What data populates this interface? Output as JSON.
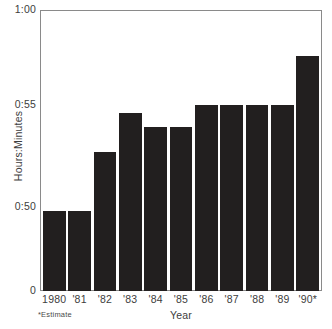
{
  "chart_data": {
    "type": "bar",
    "title": "",
    "subtitle": "",
    "xlabel": "Year",
    "ylabel": "Hours:Minutes",
    "categories": [
      "1980",
      "'81",
      "'82",
      "'83",
      "'84",
      "'85",
      "'86",
      "'87",
      "'88",
      "'89",
      "'90*"
    ],
    "values": [
      "0:49.8",
      "0:49.8",
      "0:52.7",
      "0:54.6",
      "0:53.9",
      "0:53.9",
      "0:55",
      "0:55",
      "0:55",
      "0:55",
      "0:57.6"
    ],
    "value_minutes": [
      49.8,
      49.8,
      52.7,
      54.6,
      53.9,
      53.9,
      55.0,
      55.0,
      55.0,
      55.0,
      57.6
    ],
    "ytick_labels": [
      "1:00",
      "0:55",
      "0:50",
      "0"
    ],
    "ytick_minutes": [
      60,
      55,
      50,
      0
    ],
    "ylim": [
      "0",
      "1:00"
    ],
    "grid": false,
    "legend": null,
    "axis_note": "Vertical axis is broken between 0 and 0:50",
    "annotations": [
      "*Estimate"
    ],
    "bar_color": "#221f1f",
    "axis_color": "#8a8a8a",
    "text_color": "#3d3d3d",
    "background_color": "#ffffff"
  },
  "footnote": "*Estimate"
}
